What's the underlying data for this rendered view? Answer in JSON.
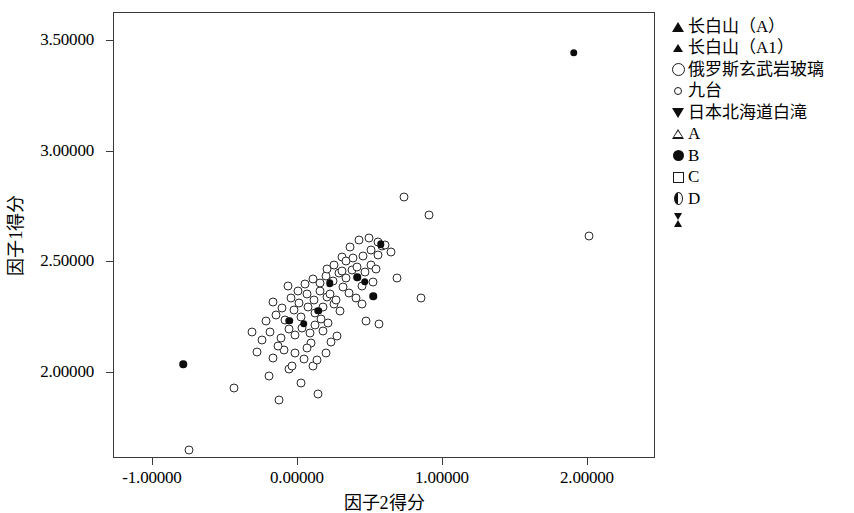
{
  "chart_data": {
    "type": "scatter",
    "title": "",
    "xlabel": "因子2得分",
    "ylabel": "因子1得分",
    "xlim": [
      -1.3,
      2.44
    ],
    "ylim": [
      1.58,
      3.6
    ],
    "grid": false,
    "legend_position": "right",
    "xticks": [
      "-1.00000",
      "0.00000",
      "1.00000",
      "2.00000"
    ],
    "xtick_values": [
      -1.0,
      0.0,
      1.0,
      2.0
    ],
    "yticks": [
      "3.50000",
      "3.00000",
      "2.50000",
      "2.00000"
    ],
    "ytick_values": [
      3.5,
      3.0,
      2.5,
      2.0
    ],
    "legend": [
      {
        "label": "长白山（A）",
        "marker": "triangle-up-filled"
      },
      {
        "label": "长白山（A1）",
        "marker": "triangle-up-filled-small"
      },
      {
        "label": "俄罗斯玄武岩玻璃",
        "marker": "circle-open-large"
      },
      {
        "label": "九台",
        "marker": "circle-open-small"
      },
      {
        "label": "日本北海道白滝",
        "marker": "triangle-down-filled"
      },
      {
        "label": "A",
        "marker": "triangle-up-open"
      },
      {
        "label": "B",
        "marker": "circle-filled"
      },
      {
        "label": "C",
        "marker": "square-open"
      },
      {
        "label": "D",
        "marker": "half-circle"
      },
      {
        "label": "",
        "marker": "hourglass"
      }
    ],
    "series": [
      {
        "name": "俄罗斯玄武岩玻璃",
        "marker": "circle-open",
        "points": [
          [
            -0.75,
            1.653
          ],
          [
            -0.44,
            1.93
          ],
          [
            -0.2,
            1.988
          ],
          [
            -0.13,
            1.876
          ],
          [
            -0.06,
            2.02
          ],
          [
            -0.17,
            2.068
          ],
          [
            -0.1,
            2.105
          ],
          [
            -0.02,
            2.09
          ],
          [
            0.04,
            2.061
          ],
          [
            0.1,
            2.03
          ],
          [
            0.02,
            1.955
          ],
          [
            0.14,
            1.905
          ],
          [
            -0.25,
            2.15
          ],
          [
            -0.19,
            2.186
          ],
          [
            -0.12,
            2.16
          ],
          [
            -0.06,
            2.2
          ],
          [
            -0.02,
            2.17
          ],
          [
            0.03,
            2.205
          ],
          [
            0.08,
            2.18
          ],
          [
            0.12,
            2.215
          ],
          [
            0.17,
            2.19
          ],
          [
            -0.22,
            2.235
          ],
          [
            -0.15,
            2.262
          ],
          [
            -0.09,
            2.24
          ],
          [
            -0.03,
            2.285
          ],
          [
            0.02,
            2.255
          ],
          [
            0.07,
            2.3
          ],
          [
            0.12,
            2.27
          ],
          [
            0.16,
            2.245
          ],
          [
            0.21,
            2.225
          ],
          [
            -0.17,
            2.32
          ],
          [
            -0.11,
            2.295
          ],
          [
            -0.05,
            2.34
          ],
          [
            0.01,
            2.318
          ],
          [
            0.06,
            2.355
          ],
          [
            0.11,
            2.33
          ],
          [
            0.15,
            2.37
          ],
          [
            0.2,
            2.345
          ],
          [
            0.25,
            2.31
          ],
          [
            0.29,
            2.28
          ],
          [
            0.05,
            2.4
          ],
          [
            0.1,
            2.425
          ],
          [
            0.15,
            2.405
          ],
          [
            0.19,
            2.44
          ],
          [
            0.24,
            2.415
          ],
          [
            0.28,
            2.45
          ],
          [
            0.33,
            2.428
          ],
          [
            0.37,
            2.465
          ],
          [
            0.31,
            2.39
          ],
          [
            0.35,
            2.36
          ],
          [
            0.4,
            2.34
          ],
          [
            0.44,
            2.31
          ],
          [
            0.41,
            2.48
          ],
          [
            0.46,
            2.455
          ],
          [
            0.5,
            2.49
          ],
          [
            0.54,
            2.468
          ],
          [
            0.45,
            2.53
          ],
          [
            0.5,
            2.555
          ],
          [
            0.55,
            2.535
          ],
          [
            0.58,
            2.572
          ],
          [
            0.36,
            2.57
          ],
          [
            0.42,
            2.6
          ],
          [
            0.49,
            2.61
          ],
          [
            0.55,
            2.59
          ],
          [
            0.6,
            2.58
          ],
          [
            0.3,
            2.525
          ],
          [
            0.25,
            2.49
          ],
          [
            0.2,
            2.47
          ],
          [
            0.64,
            2.545
          ],
          [
            0.68,
            2.43
          ],
          [
            0.56,
            2.22
          ],
          [
            0.47,
            2.235
          ],
          [
            0.73,
            2.795
          ],
          [
            0.9,
            2.715
          ],
          [
            0.85,
            2.34
          ],
          [
            2.01,
            2.62
          ],
          [
            -0.28,
            2.095
          ],
          [
            -0.32,
            2.185
          ],
          [
            0.23,
            2.14
          ],
          [
            0.27,
            2.165
          ],
          [
            -0.07,
            2.392
          ],
          [
            0.0,
            2.372
          ],
          [
            0.17,
            2.3
          ],
          [
            0.09,
            2.135
          ],
          [
            0.33,
            2.505
          ],
          [
            0.38,
            2.52
          ],
          [
            0.13,
            2.06
          ],
          [
            -0.04,
            2.03
          ],
          [
            0.06,
            2.112
          ],
          [
            -0.14,
            2.12
          ],
          [
            0.19,
            2.092
          ],
          [
            0.3,
            2.462
          ],
          [
            0.22,
            2.355
          ],
          [
            0.26,
            2.33
          ],
          [
            0.44,
            2.395
          ],
          [
            0.52,
            2.41
          ]
        ]
      },
      {
        "name": "B",
        "marker": "circle-filled",
        "points": [
          [
            1.9,
            3.448
          ],
          [
            -0.79,
            2.04
          ],
          [
            0.57,
            2.582
          ],
          [
            0.52,
            2.346
          ],
          [
            0.46,
            2.412
          ],
          [
            0.41,
            2.432
          ],
          [
            0.14,
            2.282
          ],
          [
            0.04,
            2.222
          ],
          [
            -0.06,
            2.235
          ],
          [
            0.22,
            2.405
          ]
        ]
      }
    ]
  },
  "axes": {
    "x_title": "因子2得分",
    "y_title": "因子1得分"
  }
}
